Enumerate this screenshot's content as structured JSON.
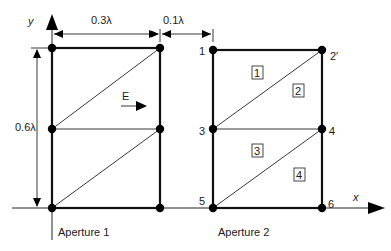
{
  "diagram": {
    "axes": {
      "x_label": "x",
      "y_label": "y"
    },
    "dimensions": {
      "width_aperture": "0.3λ",
      "gap": "0.1λ",
      "height": "0.6λ"
    },
    "field_label": "E",
    "apertures": [
      {
        "label": "Aperture 1"
      },
      {
        "label": "Aperture 2"
      }
    ],
    "nodes": [
      {
        "id": "1",
        "label": "1"
      },
      {
        "id": "2",
        "label": "2′"
      },
      {
        "id": "3",
        "label": "3"
      },
      {
        "id": "4",
        "label": "4"
      },
      {
        "id": "5",
        "label": "5"
      },
      {
        "id": "6",
        "label": "6"
      }
    ],
    "elements": [
      {
        "id": "1",
        "label": "1"
      },
      {
        "id": "2",
        "label": "2"
      },
      {
        "id": "3",
        "label": "3"
      },
      {
        "id": "4",
        "label": "4"
      }
    ]
  }
}
